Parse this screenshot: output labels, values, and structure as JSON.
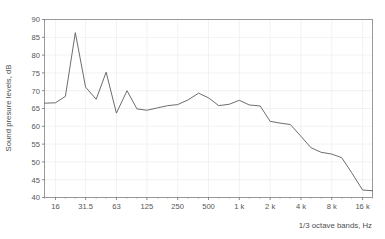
{
  "chart_data": {
    "type": "line",
    "title": "",
    "xlabel": "1/3 octave bands, Hz",
    "ylabel": "Sound presure levels, dB",
    "ylim": [
      40,
      90
    ],
    "y_ticks": [
      40,
      45,
      50,
      55,
      60,
      65,
      70,
      75,
      80,
      85,
      90
    ],
    "y_tick_labels": [
      "40",
      "45",
      "50",
      "55",
      "60",
      "65",
      "70",
      "75",
      "80",
      "85",
      "90"
    ],
    "x_tick_labels": [
      "16",
      "31.5",
      "63",
      "125",
      "250",
      "500",
      "1 k",
      "2 k",
      "4 k",
      "8 k",
      "16 k"
    ],
    "x_tick_values": [
      16,
      31.5,
      63,
      125,
      250,
      500,
      1000,
      2000,
      4000,
      8000,
      16000
    ],
    "x_scale": "log",
    "xlim": [
      12.5,
      20000
    ],
    "grid": true,
    "legend": null,
    "series": [
      {
        "name": "Sound pressure level",
        "x": [
          12.5,
          16,
          20,
          25,
          31.5,
          40,
          50,
          63,
          80,
          100,
          125,
          160,
          200,
          250,
          315,
          400,
          500,
          630,
          800,
          1000,
          1250,
          1600,
          2000,
          2500,
          3150,
          4000,
          5000,
          6300,
          8000,
          10000,
          12500,
          16000,
          20000
        ],
        "values": [
          66.5,
          66.6,
          68.4,
          86.3,
          71.0,
          67.6,
          75.2,
          63.7,
          70.0,
          64.9,
          64.5,
          65.2,
          65.8,
          66.1,
          67.4,
          69.3,
          68.0,
          65.8,
          66.2,
          67.3,
          66.0,
          65.7,
          61.4,
          60.9,
          60.5,
          57.2,
          54.0,
          52.7,
          52.2,
          51.2,
          47.0,
          42.1,
          41.9
        ]
      }
    ]
  }
}
